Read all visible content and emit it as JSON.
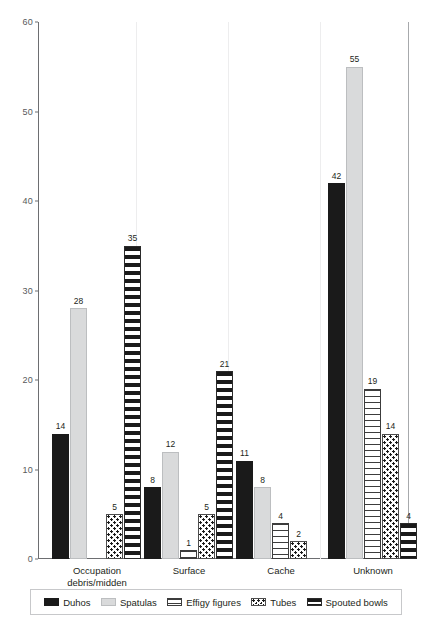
{
  "chart_data": {
    "type": "bar",
    "title": "",
    "xlabel": "",
    "ylabel": "",
    "ylim": [
      0,
      60
    ],
    "yticks": [
      0,
      10,
      20,
      30,
      40,
      50,
      60
    ],
    "grid": false,
    "legend_position": "bottom",
    "categories": [
      "Occupation\ndebris/midden",
      "Surface",
      "Cache",
      "Unknown"
    ],
    "series": [
      {
        "name": "Duhos",
        "pattern": "solid-black",
        "values": [
          14,
          8,
          11,
          42
        ]
      },
      {
        "name": "Spatulas",
        "pattern": "solid-light-gray",
        "values": [
          28,
          12,
          8,
          55
        ]
      },
      {
        "name": "Effigy figures",
        "pattern": "fine-horizontal-lines",
        "values": [
          0,
          1,
          4,
          19
        ]
      },
      {
        "name": "Tubes",
        "pattern": "dotted-stipple",
        "values": [
          5,
          5,
          2,
          14
        ]
      },
      {
        "name": "Spouted bowls",
        "pattern": "thick-horizontal-stripes",
        "values": [
          35,
          21,
          0,
          4
        ]
      }
    ],
    "bar_labels": {
      "Occupation debris/midden": [
        "14",
        "28",
        "",
        "5",
        "35"
      ],
      "Surface": [
        "8",
        "12",
        "1",
        "5",
        "21"
      ],
      "Cache": [
        "11",
        "8",
        "4",
        "2",
        ""
      ],
      "Unknown": [
        "42",
        "55",
        "19",
        "14",
        "4"
      ]
    },
    "colors": {
      "duhos": "#1a1a1a",
      "spatulas": "#d9dadb",
      "effigy_figures": "#ffffff",
      "tubes": "#ffffff",
      "spouted_bowls": "#ffffff",
      "axis": "#6d6e71",
      "text": "#231f20"
    }
  },
  "axis": {
    "y_tick_labels": [
      "0",
      "10",
      "20",
      "30",
      "40",
      "50",
      "60"
    ]
  },
  "legend": {
    "items": [
      {
        "label": "Duhos"
      },
      {
        "label": "Spatulas"
      },
      {
        "label": "Effigy figures"
      },
      {
        "label": "Tubes"
      },
      {
        "label": "Spouted bowls"
      }
    ]
  },
  "groups": [
    {
      "label": "Occupation\ndebris/midden"
    },
    {
      "label": "Surface"
    },
    {
      "label": "Cache"
    },
    {
      "label": "Unknown"
    }
  ]
}
